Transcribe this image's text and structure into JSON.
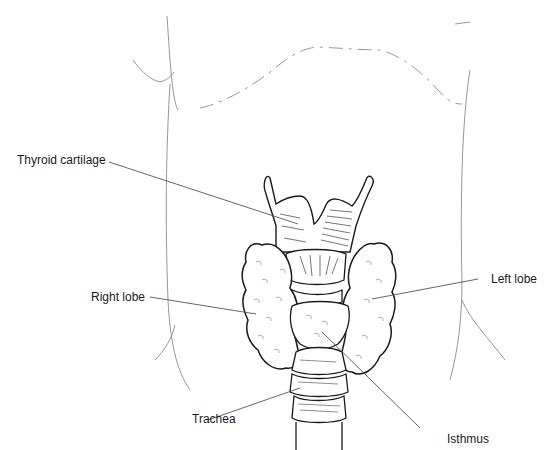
{
  "diagram": {
    "labels": [
      {
        "id": "thyroid-cartilage",
        "text": "Thyroid cartilage"
      },
      {
        "id": "right-lobe",
        "text": "Right lobe"
      },
      {
        "id": "left-lobe",
        "text": "Left lobe"
      },
      {
        "id": "trachea",
        "text": "Trachea"
      },
      {
        "id": "isthmus",
        "text": "Isthmus"
      }
    ],
    "colors": {
      "ink": "#1a1a1a",
      "outline_faint": "#8a8a8a",
      "leader": "#555555",
      "background": "#ffffff"
    }
  }
}
